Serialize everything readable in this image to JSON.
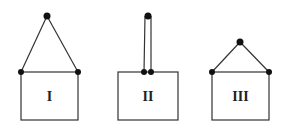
{
  "diagram": {
    "colors": {
      "line": "#333333",
      "dot": "#111111",
      "background": "#ffffff"
    },
    "figures": [
      {
        "id": "I",
        "label": "I",
        "nail": [
          47,
          16
        ],
        "attach": [
          [
            21,
            72
          ],
          [
            78,
            72
          ]
        ],
        "box": {
          "x": 21,
          "y": 72,
          "w": 57,
          "h": 48
        }
      },
      {
        "id": "II",
        "label": "II",
        "nail": [
          148,
          16
        ],
        "attach": [
          [
            144,
            72
          ],
          [
            151,
            72
          ]
        ],
        "box": {
          "x": 118,
          "y": 72,
          "w": 60,
          "h": 48
        }
      },
      {
        "id": "III",
        "label": "III",
        "nail": [
          240,
          42
        ],
        "attach": [
          [
            212,
            72
          ],
          [
            269,
            72
          ]
        ],
        "box": {
          "x": 212,
          "y": 72,
          "w": 57,
          "h": 48
        }
      }
    ]
  }
}
